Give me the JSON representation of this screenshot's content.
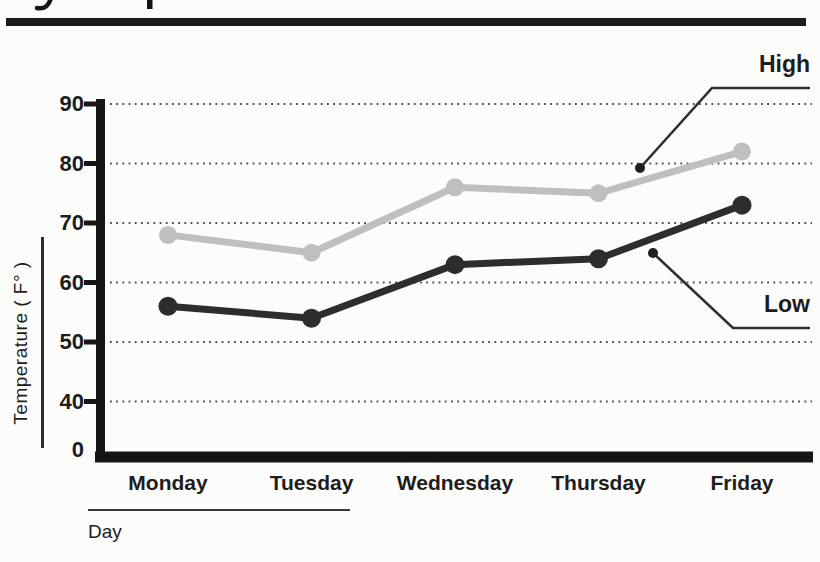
{
  "chart_data": {
    "type": "line",
    "categories": [
      "Monday",
      "Tuesday",
      "Wednesday",
      "Thursday",
      "Friday"
    ],
    "series": [
      {
        "name": "High",
        "color": "#bfbfbf",
        "values": [
          68,
          65,
          76,
          75,
          82
        ]
      },
      {
        "name": "Low",
        "color": "#2d2d2d",
        "values": [
          56,
          54,
          63,
          64,
          73
        ]
      }
    ],
    "xlabel": "Day",
    "ylabel": "Temperature ( F° )",
    "yticks": [
      90,
      80,
      70,
      60,
      50,
      40
    ],
    "origin_label": "0",
    "ylim": [
      0,
      90
    ],
    "grid": "dotted-horizontal",
    "legend": "callout annotations: High at upper right, Low at mid right, each with leader line and dot"
  },
  "colors": {
    "background": "#fcfcfb",
    "axis": "#161616",
    "top_rule": "#1b1b1b",
    "grid_dot": "#4f4f4f",
    "callout": "#2f2f2f",
    "text": "#1d1d1d"
  }
}
